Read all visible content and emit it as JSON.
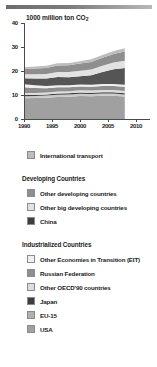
{
  "chart_data": {
    "type": "area",
    "title": "1000 million ton CO2",
    "title_main": "1000 million ton CO",
    "title_sub": "2",
    "xlabel": "",
    "ylabel": "1000 million ton CO2",
    "xlim": [
      1990,
      2010
    ],
    "ylim": [
      0,
      40
    ],
    "ytick_labels": [
      "0",
      "10",
      "20",
      "30",
      "40"
    ],
    "ytick_values": [
      0,
      10,
      20,
      30,
      40
    ],
    "xtick_labels": [
      "1990",
      "1995",
      "2000",
      "2005",
      "2010"
    ],
    "xtick_values": [
      1990,
      1995,
      2000,
      2005,
      2010
    ],
    "grid": false,
    "legend_position": "below",
    "x": [
      1990,
      1992,
      1994,
      1996,
      1998,
      2000,
      2002,
      2004,
      2006,
      2008
    ],
    "series": [
      {
        "name": "USA",
        "color": "#a0a0a0",
        "values": [
          8.6,
          8.7,
          8.9,
          9.2,
          9.3,
          9.6,
          9.5,
          9.7,
          9.7,
          9.4
        ]
      },
      {
        "name": "EU-15",
        "color": "#c9c9c9",
        "values": [
          0.9,
          0.85,
          0.85,
          0.9,
          0.9,
          0.9,
          0.9,
          0.9,
          0.9,
          0.85
        ]
      },
      {
        "name": "Japan",
        "color": "#3d3d3d",
        "values": [
          0.5,
          0.5,
          0.5,
          0.55,
          0.55,
          0.55,
          0.55,
          0.55,
          0.55,
          0.5
        ]
      },
      {
        "name": "Other OECD'90 countries",
        "color": "#dcdcdc",
        "values": [
          0.8,
          0.8,
          0.8,
          0.85,
          0.85,
          0.9,
          0.9,
          0.95,
          0.95,
          0.95
        ]
      },
      {
        "name": "Russian Federation",
        "color": "#8e8e8e",
        "values": [
          2.4,
          2.1,
          1.8,
          1.7,
          1.6,
          1.6,
          1.6,
          1.6,
          1.65,
          1.7
        ]
      },
      {
        "name": "Other Economies in Transition (EIT)",
        "color": "#efefef",
        "values": [
          1.3,
          1.1,
          0.95,
          0.9,
          0.85,
          0.85,
          0.85,
          0.85,
          0.85,
          0.85
        ]
      },
      {
        "name": "China",
        "color": "#555555",
        "values": [
          2.5,
          2.8,
          3.1,
          3.4,
          3.3,
          3.4,
          3.9,
          5.0,
          6.1,
          7.0
        ]
      },
      {
        "name": "Other big developing countries",
        "color": "#e2e2e2",
        "values": [
          1.6,
          1.8,
          1.9,
          2.1,
          2.2,
          2.3,
          2.4,
          2.6,
          2.8,
          3.0
        ]
      },
      {
        "name": "Other developing countries",
        "color": "#8e8e8e",
        "values": [
          2.2,
          2.4,
          2.5,
          2.7,
          2.8,
          3.0,
          3.2,
          3.4,
          3.6,
          3.9
        ]
      },
      {
        "name": "International transport",
        "color": "#bdbdbd",
        "values": [
          0.8,
          0.8,
          0.85,
          0.9,
          0.95,
          1.0,
          1.05,
          1.15,
          1.25,
          1.3
        ]
      }
    ],
    "totals": [
      21.6,
      21.85,
      22.15,
      23.2,
      23.3,
      24.1,
      24.85,
      26.75,
      28.45,
      29.45
    ]
  },
  "legend": {
    "standalone": [
      {
        "label": "International transport",
        "color": "#bdbdbd",
        "swatch_name": "swatch-international-transport"
      }
    ],
    "groups": [
      {
        "title": "Developing Countries",
        "items": [
          {
            "label": "Other developing countries",
            "color": "#8e8e8e",
            "swatch_name": "swatch-other-developing-countries"
          },
          {
            "label": "Other big developing countries",
            "color": "#e2e2e2",
            "swatch_name": "swatch-other-big-developing-countries"
          },
          {
            "label": "China",
            "color": "#3d3d3d",
            "swatch_name": "swatch-china"
          }
        ]
      },
      {
        "title": "Industrialized Countries",
        "items": [
          {
            "label": "Other Economies in Transition (EIT)",
            "color": "#efefef",
            "swatch_name": "swatch-other-eit"
          },
          {
            "label": "Russian Federation",
            "color": "#8e8e8e",
            "swatch_name": "swatch-russian-federation"
          },
          {
            "label": "Other OECD'90 countries",
            "color": "#dcdcdc",
            "swatch_name": "swatch-other-oecd90"
          },
          {
            "label": "Japan",
            "color": "#3d3d3d",
            "swatch_name": "swatch-japan"
          },
          {
            "label": "EU-15",
            "color": "#b0b0b0",
            "swatch_name": "swatch-eu-15"
          },
          {
            "label": "USA",
            "color": "#a0a0a0",
            "swatch_name": "swatch-usa"
          }
        ]
      }
    ]
  }
}
